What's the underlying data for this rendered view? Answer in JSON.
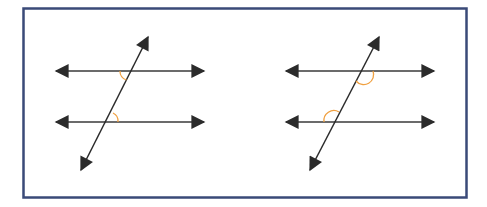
{
  "diagram": {
    "colors": {
      "frame": "#3a4a78",
      "line": "#2b2b2b",
      "angle_mark": "#f0a040",
      "background": "#ffffff"
    },
    "panels": [
      {
        "name": "left-panel",
        "angle_pair_type": "alternate-interior-angles",
        "parallel_lines": [
          {
            "x1": 41,
            "y1": 71,
            "x2": 219,
            "y2": 71
          },
          {
            "x1": 41,
            "y1": 122,
            "x2": 219,
            "y2": 122
          }
        ],
        "transversal": {
          "x1": 155,
          "y1": 23,
          "x2": 74,
          "y2": 184
        },
        "angle_marks": [
          {
            "at": "upper-intersection",
            "side": "below-left"
          },
          {
            "at": "lower-intersection",
            "side": "above-right"
          }
        ]
      },
      {
        "name": "right-panel",
        "angle_pair_type": "consecutive-interior-angles",
        "parallel_lines": [
          {
            "x1": 271,
            "y1": 71,
            "x2": 449,
            "y2": 71
          },
          {
            "x1": 271,
            "y1": 122,
            "x2": 449,
            "y2": 122
          }
        ],
        "transversal": {
          "x1": 386,
          "y1": 23,
          "x2": 303,
          "y2": 184
        },
        "angle_marks": [
          {
            "at": "upper-intersection",
            "side": "below-right"
          },
          {
            "at": "lower-intersection",
            "side": "above-left"
          }
        ]
      }
    ]
  }
}
